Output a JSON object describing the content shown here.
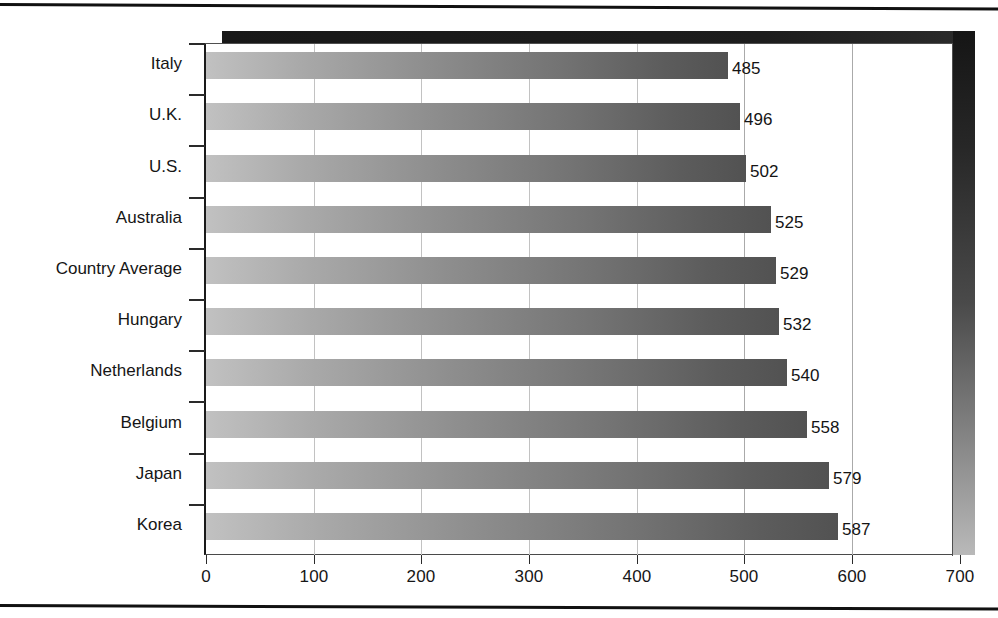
{
  "chart_data": {
    "type": "bar",
    "orientation": "horizontal",
    "title": "",
    "subtitle": "",
    "xlabel": "",
    "ylabel": "",
    "categories": [
      "Italy",
      "U.K.",
      "U.S.",
      "Australia",
      "Country Average",
      "Hungary",
      "Netherlands",
      "Belgium",
      "Japan",
      "Korea"
    ],
    "values": [
      485,
      496,
      502,
      525,
      529,
      532,
      540,
      558,
      579,
      587
    ],
    "data_labels": [
      "485",
      "496",
      "502",
      "525",
      "529",
      "532",
      "540",
      "558",
      "579",
      "587"
    ],
    "xlim": [
      0,
      700
    ],
    "xticks": [
      0,
      100,
      200,
      300,
      400,
      500,
      600,
      700
    ],
    "xtick_labels": [
      "0",
      "100",
      "200",
      "300",
      "400",
      "500",
      "600",
      "700"
    ],
    "grid": "vertical",
    "legend": "none",
    "bar_fill": "gradient light-gray to dark-gray",
    "bar_color_start": "#c1c1c1",
    "bar_color_end": "#525252",
    "plot_shadow_color": "#1a1a1a",
    "axis_color": "#1a1a1a",
    "gridline_color": "#c2c2c2",
    "text_color": "#141414",
    "background": "#ffffff"
  }
}
